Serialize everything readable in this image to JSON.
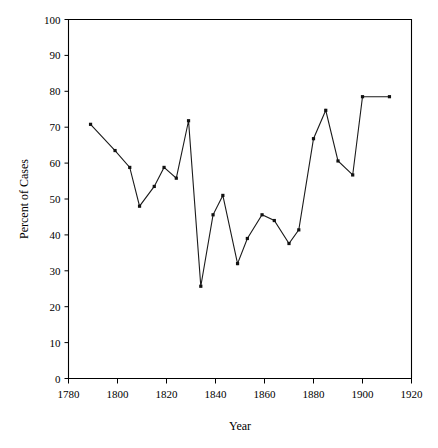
{
  "chart_data": {
    "type": "line",
    "title": "",
    "xlabel": "Year",
    "ylabel": "Percent of Cases",
    "xlim": [
      1780,
      1920
    ],
    "ylim": [
      0,
      100
    ],
    "xticks": [
      1780,
      1800,
      1820,
      1840,
      1860,
      1880,
      1900,
      1920
    ],
    "xtick_labels": [
      "1780",
      "1800",
      "1820",
      "1840",
      "1860",
      "1880",
      "1900",
      "1920"
    ],
    "yticks": [
      0,
      10,
      20,
      30,
      40,
      50,
      60,
      70,
      80,
      90,
      100
    ],
    "ytick_labels": [
      "0",
      "10",
      "20",
      "30",
      "40",
      "50",
      "60",
      "70",
      "80",
      "90",
      "100"
    ],
    "grid": false,
    "legend": false,
    "marker": "filled-square",
    "line_color": "#1a1a1a",
    "x": [
      1789,
      1799,
      1805,
      1809,
      1815,
      1819,
      1824,
      1829,
      1834,
      1839,
      1843,
      1849,
      1853,
      1859,
      1864,
      1870,
      1874,
      1880,
      1885,
      1890,
      1896,
      1900,
      1911
    ],
    "values": [
      70.8,
      63.5,
      58.8,
      48.0,
      53.5,
      58.8,
      55.8,
      71.8,
      25.7,
      45.6,
      51.0,
      32.0,
      39.0,
      45.6,
      44.0,
      37.6,
      41.4,
      66.8,
      74.7,
      60.6,
      56.7,
      78.5,
      78.5
    ],
    "series": [
      {
        "name": "Percent of Cases",
        "points": [
          {
            "x": 1789,
            "y": 70.8
          },
          {
            "x": 1799,
            "y": 63.5
          },
          {
            "x": 1805,
            "y": 58.8
          },
          {
            "x": 1809,
            "y": 48.0
          },
          {
            "x": 1815,
            "y": 53.5
          },
          {
            "x": 1819,
            "y": 58.8
          },
          {
            "x": 1824,
            "y": 55.8
          },
          {
            "x": 1829,
            "y": 71.8
          },
          {
            "x": 1834,
            "y": 25.7
          },
          {
            "x": 1839,
            "y": 45.6
          },
          {
            "x": 1843,
            "y": 51.0
          },
          {
            "x": 1849,
            "y": 32.0
          },
          {
            "x": 1853,
            "y": 39.0
          },
          {
            "x": 1859,
            "y": 45.6
          },
          {
            "x": 1864,
            "y": 44.0
          },
          {
            "x": 1870,
            "y": 37.6
          },
          {
            "x": 1874,
            "y": 41.4
          },
          {
            "x": 1880,
            "y": 66.8
          },
          {
            "x": 1885,
            "y": 74.7
          },
          {
            "x": 1890,
            "y": 60.6
          },
          {
            "x": 1896,
            "y": 56.7
          },
          {
            "x": 1900,
            "y": 78.5
          },
          {
            "x": 1911,
            "y": 78.5
          }
        ]
      }
    ]
  }
}
